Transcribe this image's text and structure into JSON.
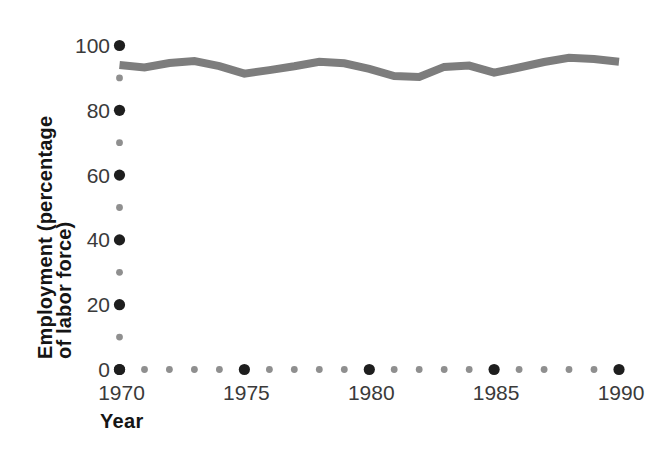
{
  "chart_data": {
    "type": "line",
    "title": "",
    "xlabel": "Year",
    "ylabel": "Employment (percentage of labor force)",
    "ylabel_lines": [
      "Employment (percentage",
      "of labor force)"
    ],
    "x": [
      1970,
      1971,
      1972,
      1973,
      1974,
      1975,
      1976,
      1977,
      1978,
      1979,
      1980,
      1981,
      1982,
      1983,
      1984,
      1985,
      1986,
      1987,
      1988,
      1989,
      1990
    ],
    "series": [
      {
        "name": "Employment as percentage of labor force",
        "values": [
          94.0,
          93.2,
          94.6,
          95.2,
          93.6,
          91.3,
          92.4,
          93.6,
          95.0,
          94.5,
          92.8,
          90.6,
          90.3,
          93.4,
          93.8,
          91.6,
          93.2,
          94.9,
          96.2,
          95.8,
          95.0
        ]
      }
    ],
    "xlim": [
      1970,
      1990
    ],
    "ylim": [
      0,
      100
    ],
    "x_tick_step": 1,
    "x_major_step": 5,
    "y_tick_step": 10,
    "y_major_step": 20,
    "x_major_tick_labels": [
      "1970",
      "1975",
      "1980",
      "1985",
      "1990"
    ],
    "y_major_tick_labels": [
      "0",
      "20",
      "40",
      "60",
      "80",
      "100"
    ],
    "grid": false,
    "legend": "none",
    "axis_style": "dotted-ticks",
    "colors": {
      "line": "#7d7d7d",
      "major_tick_dot": "#1e1e1e",
      "minor_tick_dot": "#8f8f8f",
      "tick_label": "#3a3a3a",
      "axis_title": "#151515",
      "background": "#ffffff"
    }
  }
}
